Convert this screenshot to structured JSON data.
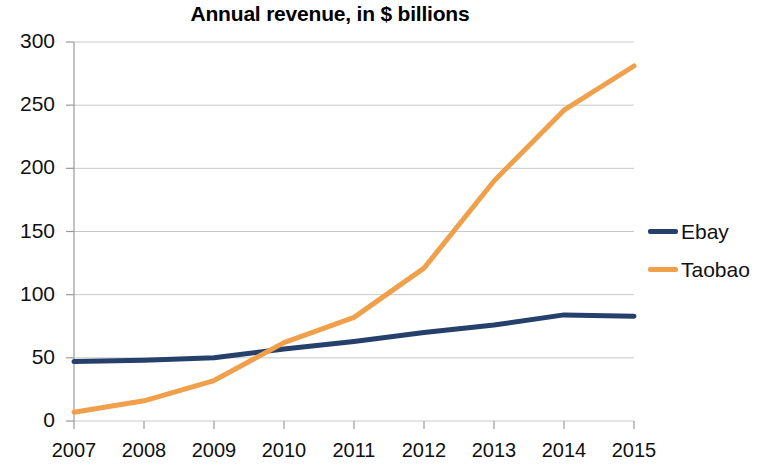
{
  "chart_data": {
    "type": "line",
    "title": "Annual revenue, in $ billions",
    "xlabel": "",
    "ylabel": "",
    "categories": [
      "2007",
      "2008",
      "2009",
      "2010",
      "2011",
      "2012",
      "2013",
      "2014",
      "2015"
    ],
    "x": [
      2007,
      2008,
      2009,
      2010,
      2011,
      2012,
      2013,
      2014,
      2015
    ],
    "series": [
      {
        "name": "Ebay",
        "color": "#24406B",
        "values": [
          47,
          48,
          50,
          57,
          63,
          70,
          76,
          84,
          83
        ]
      },
      {
        "name": "Taobao",
        "color": "#F0A04B",
        "values": [
          7,
          16,
          32,
          62,
          82,
          121,
          190,
          246,
          281
        ]
      }
    ],
    "ylim": [
      0,
      300
    ],
    "yticks": [
      0,
      50,
      100,
      150,
      200,
      250,
      300
    ],
    "ytick_labels": [
      "0",
      "50",
      "100",
      "150",
      "200",
      "250",
      "300"
    ],
    "grid": "horizontal",
    "legend_position": "right",
    "background": "#FFFFFF",
    "gridline_color": "#C8C8C8",
    "axis_color": "#9A9A9A"
  },
  "legend": {
    "items": [
      {
        "label": "Ebay",
        "color": "#24406B"
      },
      {
        "label": "Taobao",
        "color": "#F0A04B"
      }
    ]
  }
}
